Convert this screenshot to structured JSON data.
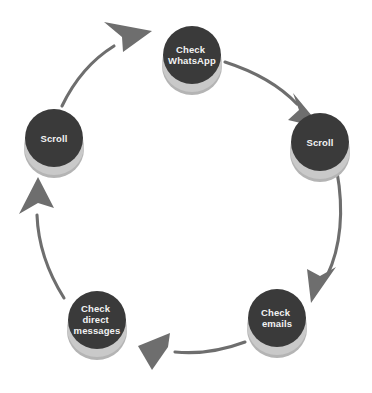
{
  "diagram": {
    "type": "cycle",
    "background_color": "#ffffff",
    "node_color": "#3a3a3a",
    "node_base_color": "#c9c9c9",
    "node_text_color": "#f2f2f2",
    "arrow_color": "#6e6e6e",
    "direction": "clockwise",
    "nodes": [
      {
        "id": "check-whatsapp",
        "lines": [
          "Check",
          "WhatsApp"
        ],
        "cx": 192,
        "cy": 55,
        "r": 29
      },
      {
        "id": "scroll-right",
        "lines": [
          "Scroll"
        ],
        "cx": 320,
        "cy": 142,
        "r": 29
      },
      {
        "id": "check-emails",
        "lines": [
          "Check",
          "emails"
        ],
        "cx": 277,
        "cy": 318,
        "r": 29
      },
      {
        "id": "check-direct-messages",
        "lines": [
          "Check",
          "direct",
          "messages"
        ],
        "cx": 97,
        "cy": 320,
        "r": 29
      },
      {
        "id": "scroll-left",
        "lines": [
          "Scroll"
        ],
        "cx": 54,
        "cy": 138,
        "r": 29
      }
    ],
    "arrows": [
      {
        "id": "whatsapp-to-scroll-right",
        "from": "check-whatsapp",
        "to": "scroll-right"
      },
      {
        "id": "scroll-right-to-emails",
        "from": "scroll-right",
        "to": "check-emails"
      },
      {
        "id": "emails-to-direct-messages",
        "from": "check-emails",
        "to": "check-direct-messages"
      },
      {
        "id": "direct-messages-to-scroll-left",
        "from": "check-direct-messages",
        "to": "scroll-left"
      },
      {
        "id": "scroll-left-to-whatsapp",
        "from": "scroll-left",
        "to": "check-whatsapp"
      }
    ]
  }
}
